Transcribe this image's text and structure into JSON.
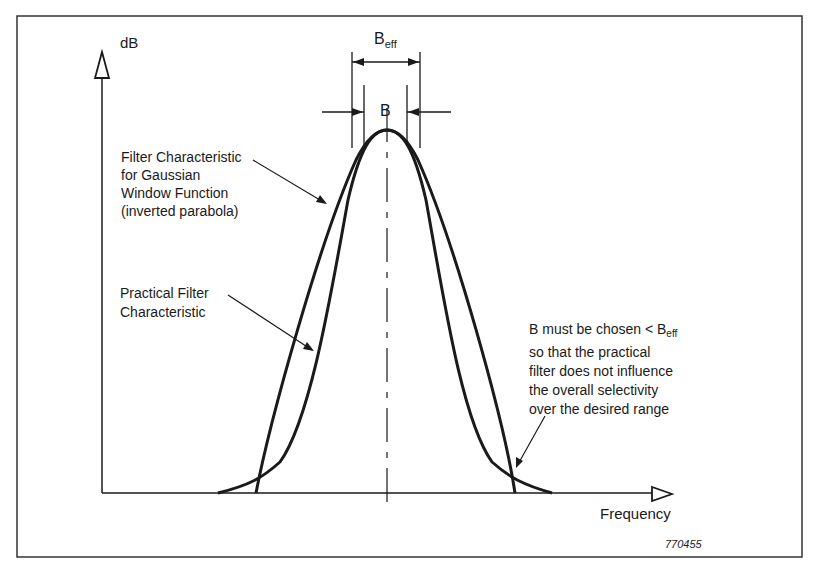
{
  "diagram": {
    "y_axis_label": "dB",
    "x_axis_label": "Frequency",
    "beff_label": {
      "main": "B",
      "sub": "eff"
    },
    "b_label": "B",
    "annotations": {
      "gaussian": [
        "Filter Characteristic",
        "for Gaussian",
        "Window Function",
        "(inverted parabola)"
      ],
      "practical": [
        "Practical Filter",
        "Characteristic"
      ],
      "note": {
        "line1_main": "B must be chosen < B",
        "line1_sub": "eff",
        "lines": [
          "so that the practical",
          "filter does not influence",
          "the overall selectivity",
          "over the desired range"
        ]
      }
    },
    "figure_id": "770455",
    "colors": {
      "ink": "#1a1a1a",
      "background": "#ffffff"
    }
  }
}
